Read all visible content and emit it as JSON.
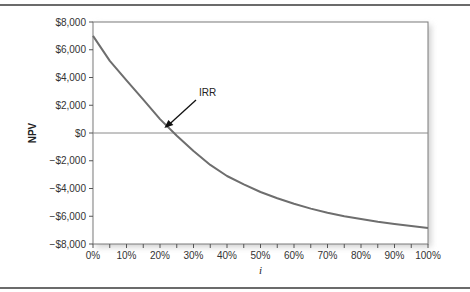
{
  "chart_data": {
    "type": "line",
    "title": "",
    "xlabel": "i",
    "ylabel": "NPV",
    "x": [
      0,
      5,
      10,
      15,
      20,
      25,
      30,
      35,
      40,
      45,
      50,
      55,
      60,
      65,
      70,
      75,
      80,
      85,
      90,
      95,
      100
    ],
    "series": [
      {
        "name": "NPV",
        "values": [
          7000,
          5200,
          3800,
          2400,
          1000,
          -200,
          -1300,
          -2300,
          -3100,
          -3700,
          -4250,
          -4700,
          -5100,
          -5450,
          -5750,
          -6000,
          -6200,
          -6400,
          -6550,
          -6700,
          -6850
        ]
      }
    ],
    "xticks": [
      "0%",
      "10%",
      "20%",
      "30%",
      "40%",
      "50%",
      "60%",
      "70%",
      "80%",
      "90%",
      "100%"
    ],
    "yticks": [
      "$8,000",
      "$6,000",
      "$4,000",
      "$2,000",
      "$0",
      "−$2,000",
      "−$4,000",
      "−$6,000",
      "−$8,000"
    ],
    "xlim": [
      0,
      100
    ],
    "ylim": [
      -8000,
      8000
    ],
    "grid": false,
    "legend": null,
    "annotations": [
      {
        "text": "IRR",
        "x": 21,
        "y": 0,
        "arrow": true
      }
    ],
    "line_color": "#6e6e6e"
  }
}
